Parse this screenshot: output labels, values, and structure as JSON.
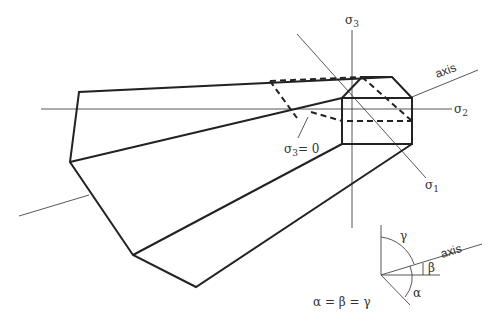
{
  "diagram": {
    "axes": {
      "sigma1": {
        "symbol": "σ",
        "subscript": "1"
      },
      "sigma2": {
        "symbol": "σ",
        "subscript": "2"
      },
      "sigma3": {
        "symbol": "σ",
        "subscript": "3"
      },
      "axis_label": "axis"
    },
    "annotation": {
      "plane_symbol": "σ",
      "plane_subscript": "3",
      "plane_value": "= 0"
    },
    "inset": {
      "axis_label": "axis",
      "alpha": "α",
      "beta": "β",
      "gamma": "γ",
      "equation": "α = β = γ"
    },
    "colors": {
      "line": "#222222",
      "thin_line": "#444444",
      "background": "#ffffff"
    }
  }
}
